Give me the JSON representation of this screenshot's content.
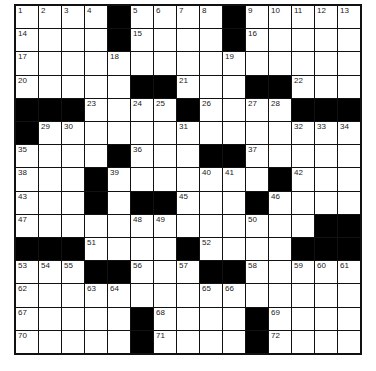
{
  "puzzle": {
    "rows": 15,
    "cols": 15,
    "grid": [
      "....#....#.....",
      "....#....#.....",
      "...............",
      ".....##...##...",
      "###....#....###",
      "#..............",
      "....#...##.....",
      "...#.......#...",
      "...#.##...#....",
      ".............#",
      "###....#....###",
      "...##...##.....",
      "...............",
      ".....#....#....",
      ".....#....#...."
    ],
    "numbers": [
      [
        1,
        2,
        3,
        4,
        0,
        5,
        6,
        7,
        8,
        0,
        9,
        10,
        11,
        12,
        13
      ],
      [
        14,
        0,
        0,
        0,
        0,
        15,
        0,
        0,
        0,
        0,
        16,
        0,
        0,
        0,
        0
      ],
      [
        17,
        0,
        0,
        0,
        18,
        0,
        0,
        0,
        0,
        19,
        0,
        0,
        0,
        0,
        0
      ],
      [
        20,
        0,
        0,
        0,
        0,
        0,
        0,
        21,
        0,
        0,
        0,
        0,
        22,
        0,
        0
      ],
      [
        0,
        0,
        0,
        23,
        0,
        24,
        25,
        0,
        26,
        0,
        27,
        28,
        0,
        0,
        0
      ],
      [
        0,
        29,
        30,
        0,
        0,
        0,
        0,
        31,
        0,
        0,
        0,
        0,
        32,
        33,
        34
      ],
      [
        35,
        0,
        0,
        0,
        0,
        36,
        0,
        0,
        0,
        0,
        37,
        0,
        0,
        0,
        0
      ],
      [
        38,
        0,
        0,
        0,
        39,
        0,
        0,
        0,
        40,
        41,
        0,
        0,
        42,
        0,
        0
      ],
      [
        43,
        0,
        0,
        44,
        0,
        0,
        0,
        45,
        0,
        0,
        0,
        46,
        0,
        0,
        0
      ],
      [
        47,
        0,
        0,
        0,
        0,
        48,
        49,
        0,
        0,
        0,
        50,
        0,
        0,
        0,
        0
      ],
      [
        0,
        0,
        0,
        51,
        0,
        0,
        0,
        0,
        52,
        0,
        0,
        0,
        0,
        0,
        0
      ],
      [
        53,
        54,
        55,
        0,
        0,
        56,
        0,
        57,
        0,
        0,
        58,
        0,
        59,
        60,
        61
      ],
      [
        62,
        0,
        0,
        63,
        64,
        0,
        0,
        0,
        65,
        66,
        0,
        0,
        0,
        0,
        0
      ],
      [
        67,
        0,
        0,
        0,
        0,
        0,
        68,
        0,
        0,
        0,
        0,
        69,
        0,
        0,
        0
      ],
      [
        70,
        0,
        0,
        0,
        0,
        0,
        71,
        0,
        0,
        0,
        0,
        72,
        0,
        0,
        0
      ]
    ]
  }
}
